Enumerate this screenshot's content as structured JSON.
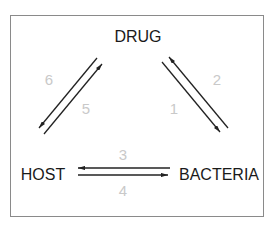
{
  "diagram": {
    "type": "cycle-relationship",
    "nodes": [
      {
        "id": "drug",
        "label": "DRUG"
      },
      {
        "id": "host",
        "label": "HOST"
      },
      {
        "id": "bacteria",
        "label": "BACTERIA"
      }
    ],
    "edges": [
      {
        "id": "1",
        "label": "1",
        "from": "drug",
        "to": "bacteria"
      },
      {
        "id": "2",
        "label": "2",
        "from": "bacteria",
        "to": "drug"
      },
      {
        "id": "3",
        "label": "3",
        "from": "bacteria",
        "to": "host"
      },
      {
        "id": "4",
        "label": "4",
        "from": "host",
        "to": "bacteria"
      },
      {
        "id": "5",
        "label": "5",
        "from": "host",
        "to": "drug"
      },
      {
        "id": "6",
        "label": "6",
        "from": "drug",
        "to": "host"
      }
    ],
    "colors": {
      "node_text": "#1a1a1a",
      "edge_label": "#c9c9c9",
      "arrow": "#222222",
      "frame": "#8a8a8a"
    }
  }
}
